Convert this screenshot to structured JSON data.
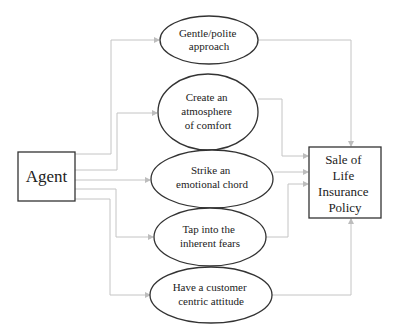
{
  "diagram": {
    "type": "flow",
    "colors": {
      "connector": "#c4c4c4",
      "outline": "#333333",
      "text": "#222222",
      "background": "#ffffff"
    },
    "source": {
      "id": "agent",
      "label": "Agent",
      "shape": "rectangle"
    },
    "target": {
      "id": "sale",
      "label_lines": [
        "Sale of",
        "Life",
        "Insurance",
        "Policy"
      ],
      "shape": "rectangle"
    },
    "strategies": [
      {
        "id": "gentle",
        "label_lines": [
          "Gentle/polite",
          "approach"
        ]
      },
      {
        "id": "comfort",
        "label_lines": [
          "Create an",
          "atmosphere",
          "of comfort"
        ]
      },
      {
        "id": "emotional",
        "label_lines": [
          "Strike an",
          "emotional chord"
        ]
      },
      {
        "id": "fears",
        "label_lines": [
          "Tap into the",
          "inherent fears"
        ]
      },
      {
        "id": "customer",
        "label_lines": [
          "Have a customer",
          "centric attitude"
        ]
      }
    ],
    "edges": [
      {
        "from": "agent",
        "to": "gentle"
      },
      {
        "from": "agent",
        "to": "comfort"
      },
      {
        "from": "agent",
        "to": "emotional"
      },
      {
        "from": "agent",
        "to": "fears"
      },
      {
        "from": "agent",
        "to": "customer"
      },
      {
        "from": "gentle",
        "to": "sale"
      },
      {
        "from": "comfort",
        "to": "sale"
      },
      {
        "from": "emotional",
        "to": "sale"
      },
      {
        "from": "fears",
        "to": "sale"
      },
      {
        "from": "customer",
        "to": "sale"
      }
    ]
  }
}
